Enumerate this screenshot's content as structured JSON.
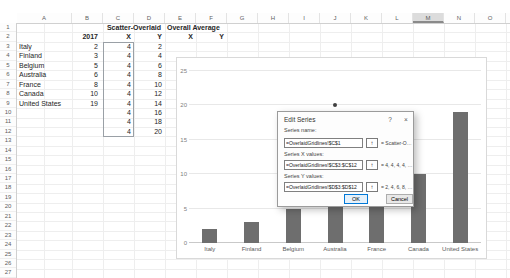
{
  "sheet": {
    "column_letters": [
      "A",
      "B",
      "C",
      "D",
      "E",
      "F",
      "G",
      "H",
      "I",
      "J",
      "K",
      "L",
      "M",
      "N",
      "O"
    ],
    "selected_column": "M",
    "row_numbers": [
      1,
      2,
      3,
      4,
      5,
      6,
      7,
      8,
      9,
      10,
      11,
      12,
      13,
      14,
      15,
      16,
      17,
      18,
      19,
      20,
      21,
      22,
      23,
      24,
      25,
      26,
      27
    ],
    "table": {
      "scatter_title": "Scatter-Overlaid",
      "year_header": "2017",
      "x_header": "X",
      "y_header": "Y",
      "rows": [
        {
          "country": "Italy",
          "value": 2
        },
        {
          "country": "Finland",
          "value": 3
        },
        {
          "country": "Belgium",
          "value": 5
        },
        {
          "country": "Australia",
          "value": 6
        },
        {
          "country": "France",
          "value": 8
        },
        {
          "country": "Canada",
          "value": 10
        },
        {
          "country": "United States",
          "value": 19
        }
      ],
      "x_values": [
        4,
        4,
        4,
        4,
        4,
        4,
        4,
        4,
        4,
        4
      ],
      "y_values": [
        2,
        4,
        6,
        8,
        10,
        12,
        14,
        16,
        18,
        20
      ]
    },
    "overall_average": {
      "title": "Overall Average",
      "x_header": "X",
      "y_header": "Y"
    }
  },
  "chart_data": {
    "type": "bar",
    "categories": [
      "Italy",
      "Finland",
      "Belgium",
      "Australia",
      "France",
      "Canada",
      "United States"
    ],
    "series": [
      {
        "name": "2017",
        "type": "bar",
        "values": [
          2,
          3,
          5,
          6,
          8,
          10,
          19
        ],
        "color": "#6e6e6e"
      },
      {
        "name": "Scatter-Overlaid",
        "type": "scatter",
        "x": [
          4,
          4,
          4,
          4,
          4,
          4,
          4,
          4,
          4,
          4
        ],
        "y": [
          2,
          4,
          6,
          8,
          10,
          12,
          14,
          16,
          18,
          20
        ],
        "color": "#404040"
      }
    ],
    "title": "",
    "xlabel": "",
    "ylabel": "",
    "ylim": [
      0,
      25
    ],
    "yticks": [
      0,
      5,
      10,
      15,
      20,
      25
    ],
    "grid": true,
    "legend": "none"
  },
  "dialog": {
    "title": "Edit Series",
    "help_icon": "?",
    "close_icon": "×",
    "range_picker_icon": "↑",
    "accent_color": "#0078d7",
    "series_name": {
      "label": "Series name:",
      "value": "=OverlaidGridlines!$C$1",
      "preview": "= Scatter-Overla..."
    },
    "series_x": {
      "label": "Series X values:",
      "value": "=OverlaidGridlines!$C$3:$C$12",
      "preview": "= 4, 4, 4, 4, 4..."
    },
    "series_y": {
      "label": "Series Y values:",
      "value": "=OverlaidGridlines!$D$3:$D$12",
      "preview": "= 2, 4, 6, 8, 10..."
    },
    "ok_label": "OK",
    "cancel_label": "Cancel"
  }
}
